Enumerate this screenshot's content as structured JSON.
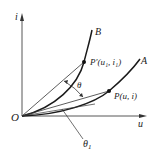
{
  "diagram": {
    "axes": {
      "y_label": "i",
      "x_label": "u",
      "origin_label": "O"
    },
    "curves": [
      {
        "name": "B",
        "label": "B"
      },
      {
        "name": "A",
        "label": "A"
      }
    ],
    "points": {
      "p_prime": {
        "label": "P′(u₁, i₁)"
      },
      "p": {
        "label": "P(u, i)"
      }
    },
    "angles": {
      "theta": "θ",
      "theta1": "θ",
      "theta1_sub": "1"
    },
    "colors": {
      "line": "#333333",
      "curve": "#1a1a1a",
      "background": "#ffffff"
    }
  }
}
